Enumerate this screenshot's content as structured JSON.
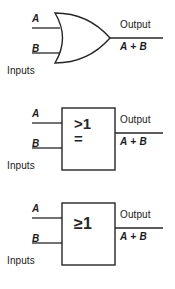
{
  "figure": {
    "background_color": "#ffffff",
    "line_color": "#262626"
  },
  "labels": {
    "input_a": "A",
    "input_b": "B",
    "inputs_group": "Inputs",
    "output_word": "Output",
    "output_expression": "A + B"
  },
  "gates": [
    {
      "id": "or-gate-distinctive-shape",
      "symbol_style": "distinctive-shape",
      "qualifier": "",
      "qualifier_line_1": "",
      "qualifier_line_2": "",
      "input_a": "A",
      "input_b": "B",
      "inputs_group": "Inputs",
      "output_word": "Output",
      "output_expression": "A + B"
    },
    {
      "id": "or-gate-rectangular-greater-than-one",
      "symbol_style": "rectangular",
      "qualifier": ">1 =",
      "qualifier_line_1": ">1",
      "qualifier_line_2": "=",
      "input_a": "A",
      "input_b": "B",
      "inputs_group": "Inputs",
      "output_word": "Output",
      "output_expression": "A + B"
    },
    {
      "id": "or-gate-rectangular-greater-equal-one",
      "symbol_style": "rectangular",
      "qualifier": "≥1",
      "qualifier_line_1": "≥1",
      "qualifier_line_2": "",
      "input_a": "A",
      "input_b": "B",
      "inputs_group": "Inputs",
      "output_word": "Output",
      "output_expression": "A + B"
    }
  ]
}
